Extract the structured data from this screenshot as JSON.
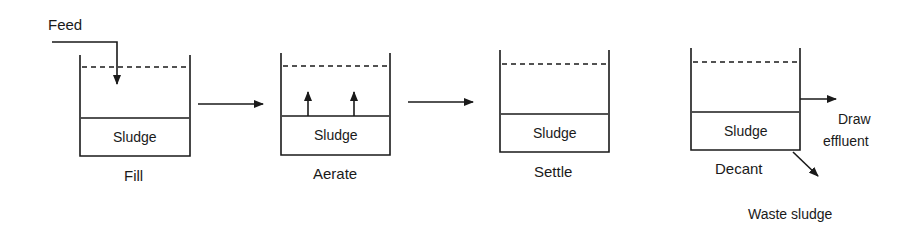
{
  "diagram": {
    "type": "sequencing-batch-reactor-cycle",
    "feed_label": "Feed",
    "tanks": [
      {
        "id": "fill",
        "stage_label": "Fill",
        "content_label": "Sludge"
      },
      {
        "id": "aerate",
        "stage_label": "Aerate",
        "content_label": "Sludge"
      },
      {
        "id": "settle",
        "stage_label": "Settle",
        "content_label": "Sludge"
      },
      {
        "id": "decant",
        "stage_label": "Decant",
        "content_label": "Sludge"
      }
    ],
    "outputs": {
      "draw_label_line1": "Draw",
      "draw_label_line2": "effluent",
      "waste_label": "Waste sludge"
    },
    "colors": {
      "line": "#1a1a1a",
      "background": "#ffffff"
    }
  }
}
